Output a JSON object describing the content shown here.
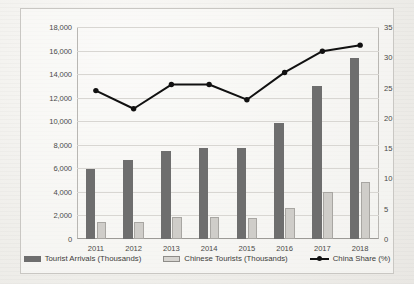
{
  "chart_data": {
    "type": "bar",
    "title": "",
    "subtitle": "",
    "xlabel": "",
    "ylabel": "",
    "grid": true,
    "legend_position": "bottom",
    "categories": [
      "2011",
      "2012",
      "2013",
      "2014",
      "2015",
      "2016",
      "2017",
      "2018"
    ],
    "left_axis": {
      "label": "",
      "ylim": [
        0,
        18000
      ],
      "tick_step": 2000,
      "ticks": [
        0,
        2000,
        4000,
        6000,
        8000,
        10000,
        12000,
        14000,
        16000,
        18000
      ],
      "tick_labels": [
        "0",
        "2,000",
        "4,000",
        "6,000",
        "8,000",
        "10,000",
        "12,000",
        "14,000",
        "16,000",
        "18,000"
      ]
    },
    "right_axis": {
      "label": "",
      "ylim": [
        0,
        35
      ],
      "tick_step": 5,
      "ticks": [
        0,
        5,
        10,
        15,
        20,
        25,
        30,
        35
      ],
      "tick_labels": [
        "0",
        "5",
        "10",
        "15",
        "20",
        "25",
        "30",
        "35"
      ]
    },
    "series": [
      {
        "name": "Tourist Arrivals  (Thousands)",
        "type": "bar",
        "axis": "left",
        "color": "#6e6e6e",
        "values": [
          5950,
          6750,
          7450,
          7700,
          7700,
          9850,
          12950,
          15400
        ]
      },
      {
        "name": "Chinese Tourists (Thousands)",
        "type": "bar",
        "axis": "left",
        "color": "#cfcdc9",
        "values": [
          1450,
          1450,
          1900,
          1900,
          1750,
          2600,
          3950,
          4850
        ]
      },
      {
        "name": "China Share (%)",
        "type": "line",
        "axis": "right",
        "color": "#111111",
        "values": [
          24.5,
          21.5,
          25.5,
          25.5,
          23.0,
          27.5,
          31.0,
          32.0
        ]
      }
    ]
  },
  "legend": {
    "items": [
      {
        "label": "Tourist Arrivals  (Thousands)",
        "marker": "dark-square-swatch"
      },
      {
        "label": "Chinese Tourists (Thousands)",
        "marker": "light-square-swatch"
      },
      {
        "label": "China Share (%)",
        "marker": "line-marker-swatch"
      }
    ]
  }
}
